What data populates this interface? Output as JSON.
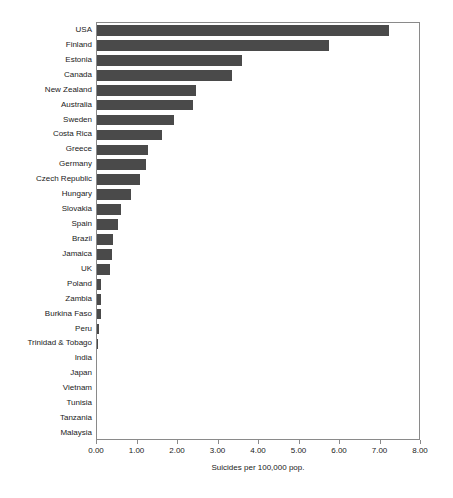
{
  "chart_data": {
    "type": "bar",
    "orientation": "horizontal",
    "title": "",
    "xlabel": "Suicides per 100,000 pop.",
    "ylabel": "",
    "xlim": [
      0,
      8
    ],
    "xticks": [
      "0.00",
      "1.00",
      "2.00",
      "3.00",
      "4.00",
      "5.00",
      "6.00",
      "7.00",
      "8.00"
    ],
    "xtick_values": [
      0,
      1,
      2,
      3,
      4,
      5,
      6,
      7,
      8
    ],
    "grid": false,
    "legend": null,
    "bar_color": "#4a4a4a",
    "axis_color": "#8a8a8a",
    "categories": [
      "USA",
      "Finland",
      "Estonia",
      "Canada",
      "New Zealand",
      "Australia",
      "Sweden",
      "Costa Rica",
      "Greece",
      "Germany",
      "Czech Republic",
      "Hungary",
      "Slovakia",
      "Spain",
      "Brazil",
      "Jamaica",
      "UK",
      "Poland",
      "Zambia",
      "Burkina Faso",
      "Peru",
      "Trinidad & Tobago",
      "India",
      "Japan",
      "Vietnam",
      "Tunisia",
      "Tanzania",
      "Malaysia"
    ],
    "values": [
      7.22,
      5.73,
      3.59,
      3.34,
      2.44,
      2.37,
      1.9,
      1.61,
      1.27,
      1.2,
      1.05,
      0.85,
      0.59,
      0.51,
      0.39,
      0.37,
      0.32,
      0.1,
      0.1,
      0.09,
      0.04,
      0.02,
      0.0,
      0.0,
      0.0,
      0.0,
      0.0,
      0.0
    ]
  }
}
